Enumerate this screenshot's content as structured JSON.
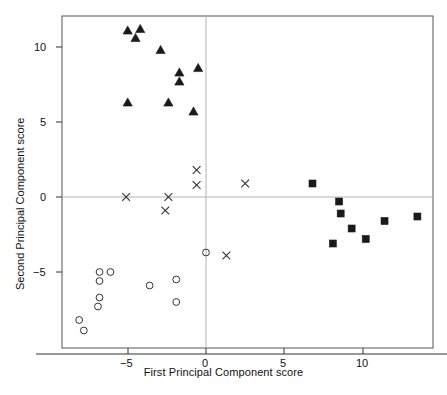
{
  "chart_data": {
    "type": "scatter",
    "title": "",
    "xlabel": "First Principal Component score",
    "ylabel": "Second Principal Component score",
    "xlim": [
      -9.2,
      14.5
    ],
    "ylim": [
      -9.1,
      12.0
    ],
    "xticks": [
      -5,
      0,
      5,
      10
    ],
    "xtick_labels": [
      "−5",
      "0",
      "5",
      "10"
    ],
    "yticks": [
      -5,
      0,
      5,
      10
    ],
    "ytick_labels": [
      "−5",
      "0",
      "5",
      "10"
    ],
    "grid": false,
    "legend": "none",
    "reference_lines": [
      {
        "axis": "x",
        "value": 0,
        "color": "#b4b4b4"
      },
      {
        "axis": "y",
        "value": 0,
        "color": "#b4b4b4"
      }
    ],
    "frame_color": "#555555",
    "marker_color": "#1a1a1a",
    "series": [
      {
        "name": "triangles",
        "marker": "triangle",
        "filled": true,
        "points": [
          [
            -5.0,
            11.1
          ],
          [
            -4.2,
            11.2
          ],
          [
            -4.5,
            10.6
          ],
          [
            -2.9,
            9.8
          ],
          [
            -1.7,
            8.3
          ],
          [
            -1.7,
            7.7
          ],
          [
            -0.5,
            8.6
          ],
          [
            -5.0,
            6.3
          ],
          [
            -2.4,
            6.3
          ],
          [
            -0.8,
            5.7
          ]
        ]
      },
      {
        "name": "crosses",
        "marker": "x",
        "filled": false,
        "points": [
          [
            -5.1,
            0.0
          ],
          [
            -2.4,
            0.0
          ],
          [
            -2.6,
            -0.9
          ],
          [
            -0.6,
            1.8
          ],
          [
            -0.6,
            0.8
          ],
          [
            2.5,
            0.9
          ],
          [
            1.3,
            -3.9
          ]
        ]
      },
      {
        "name": "squares",
        "marker": "square",
        "filled": true,
        "points": [
          [
            6.8,
            0.9
          ],
          [
            8.5,
            -0.3
          ],
          [
            8.6,
            -1.1
          ],
          [
            8.1,
            -3.1
          ],
          [
            9.3,
            -2.1
          ],
          [
            10.2,
            -2.8
          ],
          [
            11.4,
            -1.6
          ],
          [
            13.5,
            -1.3
          ]
        ]
      },
      {
        "name": "circles",
        "marker": "circle",
        "filled": false,
        "points": [
          [
            -6.8,
            -5.0
          ],
          [
            -6.1,
            -5.0
          ],
          [
            -6.8,
            -5.6
          ],
          [
            -6.8,
            -6.7
          ],
          [
            -6.9,
            -7.3
          ],
          [
            -8.1,
            -8.2
          ],
          [
            -7.8,
            -8.9
          ],
          [
            -3.6,
            -5.9
          ],
          [
            -1.9,
            -5.5
          ],
          [
            -1.9,
            -7.0
          ],
          [
            0.0,
            -3.7
          ]
        ]
      }
    ]
  },
  "axes": {
    "xlabel": "First Principal Component score",
    "ylabel": "Second Principal Component score",
    "xtick_labels": [
      "−5",
      "0",
      "5",
      "10"
    ],
    "ytick_labels": [
      "10",
      "5",
      "0",
      "−5"
    ]
  }
}
